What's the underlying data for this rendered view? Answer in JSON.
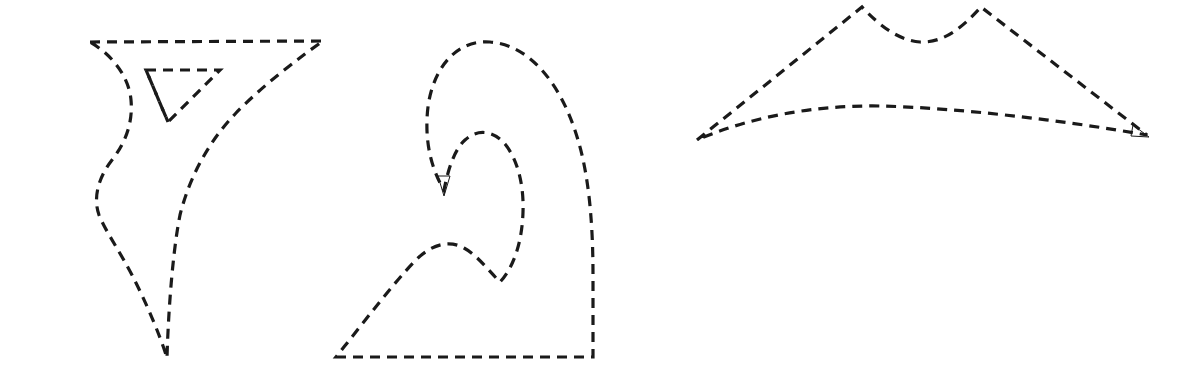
{
  "canvas": {
    "width": 1193,
    "height": 382,
    "background_color": "#ffffff",
    "title": "Dashed outline shapes"
  },
  "style": {
    "stroke_color": "#1a1a1a",
    "stroke_width": 3.2,
    "dash_length": 10,
    "dash_gap": 7,
    "fill": "none"
  },
  "figures": [
    {
      "id": "figure-left",
      "name": "left-dashed-shape",
      "description": "Curved triangular outline with inner triangle notch",
      "paths": [
        {
          "name": "outer-contour",
          "d": "M 90 42 L 323 41 C 300 57 262 86 236 113 C 210 140 190 175 180 215 C 172 255 168 320 167 358 C 160 335 145 300 132 275 C 119 250 106 232 99 215 C 93 198 98 178 112 160 C 126 142 133 122 131 100 C 129 78 114 56 90 42 Z"
        },
        {
          "name": "inner-triangle",
          "d": "M 146 70 L 220 70 L 168 122 Z"
        },
        {
          "name": "inner-left-stroke",
          "d": "M 146 70 L 168 122"
        }
      ]
    },
    {
      "id": "figure-middle",
      "name": "middle-dashed-shape",
      "description": "Wave/hook outline with inward spiral cusp and arrowhead",
      "paths": [
        {
          "name": "outer-contour",
          "d": "M 336 357 L 593 357 L 593 276 C 593 230 590 180 578 140 C 563 88 532 45 490 42 C 452 39 428 76 427 120 C 426 146 432 170 444 190 C 448 170 454 150 465 140 C 478 128 494 131 505 144 C 518 160 524 186 523 212 C 522 244 513 268 500 282 C 488 270 477 255 464 248 C 448 239 430 245 414 262 C 392 285 364 322 336 357 Z"
        },
        {
          "name": "arrowhead-down",
          "d": "M 438 176 L 444 196 L 450 176 Z",
          "arrow": true
        }
      ]
    },
    {
      "id": "figure-right",
      "name": "right-dashed-shape",
      "description": "Wide crescent outline with twin peaks along upper edge",
      "paths": [
        {
          "name": "outer-contour",
          "d": "M 697 140 L 862 7 C 880 26 898 40 920 42 C 944 43 963 27 981 7 L 1147 135 C 1060 120 960 108 880 106 C 810 105 748 118 697 140 Z"
        },
        {
          "name": "arrowhead-right",
          "d": "M 1133 125 L 1149 137 L 1131 136 Z",
          "arrow": true
        }
      ]
    }
  ]
}
